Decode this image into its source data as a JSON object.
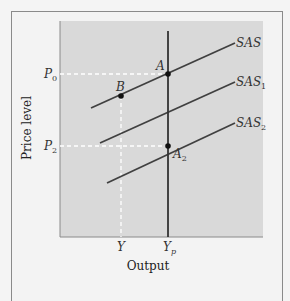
{
  "diagram": {
    "type": "economics-diagram",
    "x_axis": {
      "label": "Output",
      "ticks": [
        "Y",
        "Y_p"
      ]
    },
    "y_axis": {
      "label": "Price level",
      "ticks": [
        "P_0",
        "P_2"
      ]
    },
    "curves": [
      {
        "id": "SAS",
        "label": "SAS",
        "sub": ""
      },
      {
        "id": "SAS1",
        "label": "SAS",
        "sub": "1"
      },
      {
        "id": "SAS2",
        "label": "SAS",
        "sub": "2"
      },
      {
        "id": "LAS",
        "label": "",
        "sub": ""
      }
    ],
    "points": [
      {
        "id": "A",
        "label": "A",
        "sub": ""
      },
      {
        "id": "B",
        "label": "B",
        "sub": ""
      },
      {
        "id": "A2",
        "label": "A",
        "sub": "2"
      }
    ],
    "labels": {
      "P0_main": "P",
      "P0_sub": "0",
      "P2_main": "P",
      "P2_sub": "2",
      "Y": "Y",
      "Yp_main": "Y",
      "Yp_sub": "p",
      "xlabel": "Output",
      "ylabel": "Price level",
      "SAS": "SAS",
      "SAS1_main": "SAS",
      "SAS1_sub": "1",
      "SAS2_main": "SAS",
      "SAS2_sub": "2",
      "A": "A",
      "B": "B",
      "A2_main": "A",
      "A2_sub": "2"
    },
    "colors": {
      "plot_bg": "#d9d9d9",
      "frame_bg": "#f3f3f3",
      "line": "#404040",
      "dash": "#ffffff"
    }
  }
}
